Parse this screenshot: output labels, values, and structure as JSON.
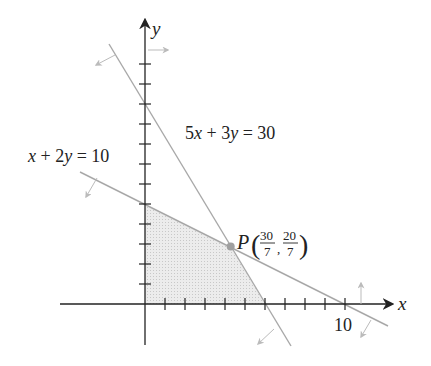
{
  "diagram": {
    "type": "linear-programming-feasible-region",
    "axes": {
      "x_label": "x",
      "y_label": "y",
      "x_tick_label": "10",
      "x_ticks": 11,
      "y_ticks": 11,
      "scale_px_per_unit": 20
    },
    "constraints": [
      {
        "label_parts": {
          "a": "x",
          "op1": " + 2",
          "b": "y",
          "rest": " = 10"
        },
        "equation": "x + 2y = 10"
      },
      {
        "label_parts": {
          "a": "5",
          "ax": "x",
          "op1": " + 3",
          "b": "y",
          "rest": " = 30"
        },
        "equation": "5x + 3y = 30"
      }
    ],
    "point": {
      "name": "P",
      "x_num": "30",
      "x_den": "7",
      "y_num": "20",
      "y_den": "7",
      "coords": [
        4.2857,
        2.8571
      ]
    },
    "feasible_region_vertices": [
      [
        0,
        0
      ],
      [
        6,
        0
      ],
      [
        4.2857,
        2.8571
      ],
      [
        0,
        5
      ]
    ],
    "colors": {
      "axis": "#222222",
      "line": "#a8a8a8",
      "arrow": "#bbbbbb",
      "region": "#e4e4e4",
      "point": "#a0a0a0"
    }
  }
}
